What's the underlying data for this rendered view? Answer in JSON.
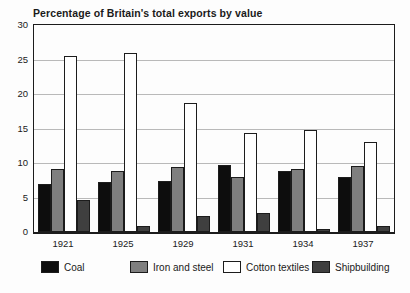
{
  "title": "Percentage of Britain's total exports by value",
  "colors": {
    "coal": "#0d0d0d",
    "iron_and_steel": "#7f7f7f",
    "cotton_textiles": "#ffffff",
    "shipbuilding": "#3f3f3f",
    "plot_border": "#1c1c1c",
    "gridline": "#b9b9b9"
  },
  "chart_data": {
    "type": "bar",
    "title": "Percentage of Britain's total exports by value",
    "categories": [
      "1921",
      "1925",
      "1929",
      "1931",
      "1934",
      "1937"
    ],
    "series": [
      {
        "name": "Coal",
        "color": "#0d0d0d",
        "values": [
          6.9,
          7.2,
          7.4,
          9.7,
          8.9,
          8.0
        ]
      },
      {
        "name": "Iron and steel",
        "color": "#7f7f7f",
        "values": [
          9.1,
          8.9,
          9.4,
          8.0,
          9.1,
          9.6
        ]
      },
      {
        "name": "Cotton textiles",
        "color": "#ffffff",
        "values": [
          25.5,
          26.0,
          18.7,
          14.4,
          14.8,
          13.0
        ]
      },
      {
        "name": "Shipbuilding",
        "color": "#3f3f3f",
        "values": [
          4.7,
          0.9,
          2.3,
          2.8,
          0.5,
          0.9
        ]
      }
    ],
    "xlabel": "",
    "ylabel": "",
    "ylim": [
      0,
      30
    ],
    "yticks": [
      0,
      5,
      10,
      15,
      20,
      25,
      30
    ],
    "grid": true,
    "legend_position": "bottom"
  }
}
